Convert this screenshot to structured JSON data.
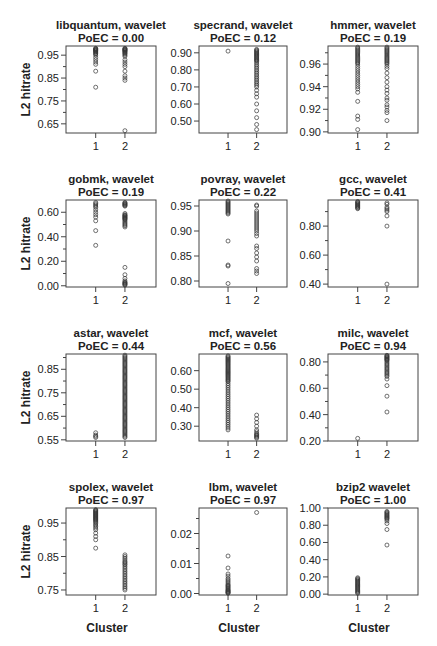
{
  "figure": {
    "shared_ylabel": "L2 hitrate",
    "shared_xlabel": "Cluster",
    "x_ticks": [
      "1",
      "2"
    ]
  },
  "chart_data": [
    {
      "type": "scatter",
      "title": "libquantum, wavelet",
      "subtitle": "PoEC = 0.00",
      "xlabel": "",
      "ylabel": "L2 hitrate",
      "ylim": [
        0.61,
        0.99
      ],
      "yticks": [
        0.65,
        0.75,
        0.85,
        0.95
      ],
      "ytick_labels": [
        "0.65",
        "0.75",
        "0.85",
        "0.95"
      ],
      "yminor": [
        0.7,
        0.8,
        0.9
      ],
      "categories": [
        "1",
        "2"
      ],
      "series": [
        {
          "name": "Cluster 1",
          "values": [
            0.98,
            0.978,
            0.976,
            0.974,
            0.972,
            0.97,
            0.968,
            0.965,
            0.962,
            0.958,
            0.955,
            0.95,
            0.94,
            0.93,
            0.92,
            0.91,
            0.88,
            0.81
          ]
        },
        {
          "name": "Cluster 2",
          "values": [
            0.98,
            0.978,
            0.976,
            0.974,
            0.972,
            0.97,
            0.968,
            0.965,
            0.962,
            0.958,
            0.955,
            0.95,
            0.945,
            0.93,
            0.92,
            0.91,
            0.9,
            0.88,
            0.86,
            0.85,
            0.84,
            0.62
          ]
        }
      ]
    },
    {
      "type": "scatter",
      "title": "specrand, wavelet",
      "subtitle": "PoEC = 0.12",
      "xlabel": "",
      "ylabel": "",
      "ylim": [
        0.43,
        0.94
      ],
      "yticks": [
        0.5,
        0.6,
        0.7,
        0.8,
        0.9
      ],
      "ytick_labels": [
        "0.50",
        "0.60",
        "0.70",
        "0.80",
        "0.90"
      ],
      "yminor": [],
      "categories": [
        "1",
        "2"
      ],
      "series": [
        {
          "name": "Cluster 1",
          "values": [
            0.91
          ]
        },
        {
          "name": "Cluster 2",
          "values": [
            0.92,
            0.915,
            0.91,
            0.905,
            0.9,
            0.895,
            0.89,
            0.885,
            0.88,
            0.875,
            0.87,
            0.865,
            0.86,
            0.855,
            0.85,
            0.84,
            0.83,
            0.82,
            0.81,
            0.8,
            0.79,
            0.78,
            0.77,
            0.76,
            0.75,
            0.74,
            0.73,
            0.72,
            0.71,
            0.7,
            0.68,
            0.66,
            0.64,
            0.6,
            0.56,
            0.52,
            0.48,
            0.45
          ]
        }
      ]
    },
    {
      "type": "scatter",
      "title": "hmmer, wavelet",
      "subtitle": "PoEC = 0.19",
      "xlabel": "",
      "ylabel": "",
      "ylim": [
        0.899,
        0.976
      ],
      "yticks": [
        0.9,
        0.92,
        0.94,
        0.96
      ],
      "ytick_labels": [
        "0.90",
        "0.92",
        "0.94",
        "0.96"
      ],
      "yminor": [
        0.91,
        0.93,
        0.95,
        0.97
      ],
      "categories": [
        "1",
        "2"
      ],
      "series": [
        {
          "name": "Cluster 1",
          "values": [
            0.975,
            0.974,
            0.973,
            0.972,
            0.971,
            0.97,
            0.969,
            0.968,
            0.967,
            0.966,
            0.965,
            0.964,
            0.963,
            0.962,
            0.961,
            0.96,
            0.958,
            0.956,
            0.954,
            0.952,
            0.95,
            0.948,
            0.946,
            0.944,
            0.942,
            0.94,
            0.938,
            0.935,
            0.927,
            0.914,
            0.911,
            0.902
          ]
        },
        {
          "name": "Cluster 2",
          "values": [
            0.975,
            0.974,
            0.973,
            0.972,
            0.971,
            0.97,
            0.969,
            0.968,
            0.967,
            0.966,
            0.965,
            0.964,
            0.963,
            0.962,
            0.961,
            0.96,
            0.958,
            0.956,
            0.952,
            0.948,
            0.944,
            0.94,
            0.937,
            0.934,
            0.93,
            0.928,
            0.924,
            0.922,
            0.919,
            0.917,
            0.91
          ]
        }
      ]
    },
    {
      "type": "scatter",
      "title": "gobmk, wavelet",
      "subtitle": "PoEC = 0.19",
      "xlabel": "",
      "ylabel": "L2 hitrate",
      "ylim": [
        -0.01,
        0.7
      ],
      "yticks": [
        0.0,
        0.2,
        0.4,
        0.6
      ],
      "ytick_labels": [
        "0.00",
        "0.20",
        "0.40",
        "0.60"
      ],
      "yminor": [
        0.1,
        0.3,
        0.5
      ],
      "categories": [
        "1",
        "2"
      ],
      "series": [
        {
          "name": "Cluster 1",
          "values": [
            0.68,
            0.67,
            0.66,
            0.65,
            0.64,
            0.62,
            0.6,
            0.58,
            0.56,
            0.53,
            0.45,
            0.33
          ]
        },
        {
          "name": "Cluster 2",
          "values": [
            0.68,
            0.675,
            0.67,
            0.665,
            0.66,
            0.655,
            0.65,
            0.59,
            0.58,
            0.575,
            0.57,
            0.565,
            0.56,
            0.555,
            0.55,
            0.545,
            0.54,
            0.53,
            0.52,
            0.51,
            0.5,
            0.49,
            0.48,
            0.15,
            0.09,
            0.06,
            0.04,
            0.03,
            0.025,
            0.02,
            0.015,
            0.01,
            0.005
          ]
        }
      ]
    },
    {
      "type": "scatter",
      "title": "povray, wavelet",
      "subtitle": "PoEC = 0.22",
      "xlabel": "",
      "ylabel": "",
      "ylim": [
        0.788,
        0.962
      ],
      "yticks": [
        0.8,
        0.85,
        0.9,
        0.95
      ],
      "ytick_labels": [
        "0.80",
        "0.85",
        "0.90",
        "0.95"
      ],
      "yminor": [],
      "categories": [
        "1",
        "2"
      ],
      "series": [
        {
          "name": "Cluster 1",
          "values": [
            0.96,
            0.958,
            0.956,
            0.954,
            0.952,
            0.95,
            0.948,
            0.946,
            0.944,
            0.942,
            0.94,
            0.938,
            0.936,
            0.934,
            0.88,
            0.832,
            0.83,
            0.795
          ]
        },
        {
          "name": "Cluster 2",
          "values": [
            0.952,
            0.95,
            0.94,
            0.936,
            0.932,
            0.928,
            0.924,
            0.92,
            0.916,
            0.912,
            0.908,
            0.904,
            0.9,
            0.895,
            0.89,
            0.87,
            0.865,
            0.856,
            0.848,
            0.84,
            0.825,
            0.82,
            0.815
          ]
        }
      ]
    },
    {
      "type": "scatter",
      "title": "gcc, wavelet",
      "subtitle": "PoEC = 0.41",
      "xlabel": "",
      "ylabel": "",
      "ylim": [
        0.38,
        0.98
      ],
      "yticks": [
        0.4,
        0.6,
        0.8
      ],
      "ytick_labels": [
        "0.40",
        "0.60",
        "0.80"
      ],
      "yminor": [
        0.5,
        0.7,
        0.9
      ],
      "categories": [
        "1",
        "2"
      ],
      "series": [
        {
          "name": "Cluster 1",
          "values": [
            0.97,
            0.965,
            0.96,
            0.955,
            0.95,
            0.945,
            0.94,
            0.935,
            0.93,
            0.925,
            0.92
          ]
        },
        {
          "name": "Cluster 2",
          "values": [
            0.96,
            0.95,
            0.93,
            0.92,
            0.91,
            0.9,
            0.87,
            0.8,
            0.4
          ]
        }
      ]
    },
    {
      "type": "scatter",
      "title": "astar, wavelet",
      "subtitle": "PoEC = 0.44",
      "xlabel": "",
      "ylabel": "L2 hitrate",
      "ylim": [
        0.545,
        0.915
      ],
      "yticks": [
        0.55,
        0.65,
        0.75,
        0.85
      ],
      "ytick_labels": [
        "0.55",
        "0.65",
        "0.75",
        "0.85"
      ],
      "yminor": [
        0.6,
        0.7,
        0.8,
        0.9
      ],
      "categories": [
        "1",
        "2"
      ],
      "series": [
        {
          "name": "Cluster 1",
          "values": [
            0.58,
            0.57,
            0.565,
            0.56
          ]
        },
        {
          "name": "Cluster 2",
          "values": [
            0.91,
            0.905,
            0.9,
            0.895,
            0.89,
            0.885,
            0.88,
            0.875,
            0.87,
            0.865,
            0.86,
            0.855,
            0.85,
            0.845,
            0.84,
            0.835,
            0.83,
            0.825,
            0.82,
            0.815,
            0.81,
            0.805,
            0.8,
            0.795,
            0.79,
            0.785,
            0.78,
            0.775,
            0.77,
            0.765,
            0.76,
            0.755,
            0.75,
            0.745,
            0.74,
            0.735,
            0.73,
            0.725,
            0.72,
            0.715,
            0.71,
            0.705,
            0.7,
            0.695,
            0.69,
            0.685,
            0.68,
            0.675,
            0.67,
            0.665,
            0.66,
            0.655,
            0.65,
            0.645,
            0.64,
            0.635,
            0.63,
            0.625,
            0.62,
            0.615,
            0.61,
            0.605,
            0.6,
            0.595,
            0.59,
            0.585,
            0.58,
            0.575,
            0.57,
            0.565,
            0.56
          ]
        }
      ]
    },
    {
      "type": "scatter",
      "title": "mcf, wavelet",
      "subtitle": "PoEC = 0.56",
      "xlabel": "",
      "ylabel": "",
      "ylim": [
        0.22,
        0.69
      ],
      "yticks": [
        0.3,
        0.4,
        0.5,
        0.6
      ],
      "ytick_labels": [
        "0.30",
        "0.40",
        "0.50",
        "0.60"
      ],
      "yminor": [],
      "categories": [
        "1",
        "2"
      ],
      "series": [
        {
          "name": "Cluster 1",
          "values": [
            0.68,
            0.675,
            0.67,
            0.665,
            0.66,
            0.655,
            0.65,
            0.645,
            0.64,
            0.635,
            0.63,
            0.625,
            0.62,
            0.615,
            0.61,
            0.605,
            0.6,
            0.595,
            0.59,
            0.585,
            0.58,
            0.575,
            0.57,
            0.565,
            0.56,
            0.555,
            0.55,
            0.545,
            0.54,
            0.53,
            0.52,
            0.51,
            0.5,
            0.49,
            0.48,
            0.47,
            0.46,
            0.45,
            0.44,
            0.43,
            0.42,
            0.41,
            0.4,
            0.39,
            0.38,
            0.37,
            0.36,
            0.35,
            0.34,
            0.33,
            0.32,
            0.31,
            0.3,
            0.29,
            0.28
          ]
        },
        {
          "name": "Cluster 2",
          "values": [
            0.36,
            0.34,
            0.32,
            0.3,
            0.28,
            0.27,
            0.26,
            0.255,
            0.25,
            0.245,
            0.24,
            0.235
          ]
        }
      ]
    },
    {
      "type": "scatter",
      "title": "milc, wavelet",
      "subtitle": "PoEC = 0.94",
      "xlabel": "",
      "ylabel": "",
      "ylim": [
        0.2,
        0.86
      ],
      "yticks": [
        0.2,
        0.4,
        0.6,
        0.8
      ],
      "ytick_labels": [
        "0.20",
        "0.40",
        "0.60",
        "0.80"
      ],
      "yminor": [
        0.3,
        0.5,
        0.7
      ],
      "categories": [
        "1",
        "2"
      ],
      "series": [
        {
          "name": "Cluster 1",
          "values": [
            0.22
          ]
        },
        {
          "name": "Cluster 2",
          "values": [
            0.85,
            0.845,
            0.84,
            0.835,
            0.83,
            0.825,
            0.82,
            0.815,
            0.81,
            0.8,
            0.79,
            0.78,
            0.77,
            0.76,
            0.75,
            0.74,
            0.73,
            0.72,
            0.71,
            0.7,
            0.69,
            0.67,
            0.62,
            0.54,
            0.42
          ]
        }
      ]
    },
    {
      "type": "scatter",
      "title": "spolex, wavelet",
      "subtitle": "PoEC = 0.97",
      "xlabel": "Cluster",
      "ylabel": "L2 hitrate",
      "ylim": [
        0.735,
        0.995
      ],
      "yticks": [
        0.75,
        0.85,
        0.95
      ],
      "ytick_labels": [
        "0.75",
        "0.85",
        "0.95"
      ],
      "yminor": [
        0.8,
        0.9
      ],
      "categories": [
        "1",
        "2"
      ],
      "series": [
        {
          "name": "Cluster 1",
          "values": [
            0.99,
            0.988,
            0.986,
            0.984,
            0.982,
            0.98,
            0.978,
            0.976,
            0.974,
            0.972,
            0.97,
            0.968,
            0.966,
            0.964,
            0.962,
            0.96,
            0.958,
            0.955,
            0.952,
            0.948,
            0.944,
            0.94,
            0.935,
            0.93,
            0.92,
            0.91,
            0.9,
            0.875
          ]
        },
        {
          "name": "Cluster 2",
          "values": [
            0.855,
            0.85,
            0.845,
            0.84,
            0.835,
            0.832,
            0.828,
            0.825,
            0.82,
            0.815,
            0.81,
            0.805,
            0.8,
            0.795,
            0.79,
            0.785,
            0.78,
            0.775,
            0.77,
            0.765,
            0.76,
            0.755,
            0.75
          ]
        }
      ]
    },
    {
      "type": "scatter",
      "title": "lbm, wavelet",
      "subtitle": "PoEC = 0.97",
      "xlabel": "Cluster",
      "ylabel": "",
      "ylim": [
        -0.0005,
        0.0285
      ],
      "yticks": [
        0.0,
        0.01,
        0.02
      ],
      "ytick_labels": [
        "0.00",
        "0.01",
        "0.02"
      ],
      "yminor": [
        0.005,
        0.015,
        0.025
      ],
      "categories": [
        "1",
        "2"
      ],
      "series": [
        {
          "name": "Cluster 1",
          "values": [
            0.0125,
            0.0085,
            0.0065,
            0.0058,
            0.005,
            0.0045,
            0.004,
            0.0035,
            0.003,
            0.0027,
            0.0024,
            0.0021,
            0.0018,
            0.0015,
            0.0012,
            0.001,
            0.0008,
            0.0006,
            0.0004,
            0.0002,
            0.0001
          ]
        },
        {
          "name": "Cluster 2",
          "values": [
            0.027
          ]
        }
      ]
    },
    {
      "type": "scatter",
      "title": "bzip2 wavelet",
      "subtitle": "PoEC = 1.00",
      "xlabel": "Cluster",
      "ylabel": "",
      "ylim": [
        -0.01,
        1.0
      ],
      "yticks": [
        0.0,
        0.2,
        0.4,
        0.6,
        0.8,
        1.0
      ],
      "ytick_labels": [
        "0.00",
        "0.20",
        "0.40",
        "0.60",
        "0.80",
        "1.00"
      ],
      "yminor": [],
      "categories": [
        "1",
        "2"
      ],
      "series": [
        {
          "name": "Cluster 1",
          "values": [
            0.19,
            0.18,
            0.17,
            0.16,
            0.15,
            0.14,
            0.13,
            0.12,
            0.11,
            0.1,
            0.09,
            0.08,
            0.07,
            0.06,
            0.05,
            0.04,
            0.03,
            0.02,
            0.01
          ]
        },
        {
          "name": "Cluster 2",
          "values": [
            0.96,
            0.95,
            0.94,
            0.93,
            0.92,
            0.91,
            0.9,
            0.89,
            0.88,
            0.87,
            0.85,
            0.82,
            0.75,
            0.57
          ]
        }
      ]
    }
  ]
}
